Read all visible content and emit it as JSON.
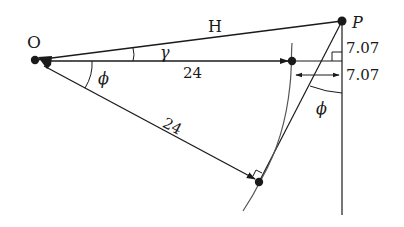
{
  "diagram": {
    "points": {
      "O": {
        "label": "O",
        "x": 36,
        "y": 60
      },
      "P": {
        "label": "P",
        "x": 342,
        "y": 21
      },
      "A": {
        "label": "",
        "x": 292,
        "y": 61
      },
      "B": {
        "label": "",
        "x": 259,
        "y": 182
      }
    },
    "labels": {
      "O": "O",
      "P": "P",
      "H": "H",
      "gamma": "γ",
      "phi_left": "ϕ",
      "phi_right": "ϕ",
      "horizontal_length": "24",
      "slanted_length": "24",
      "vertical_offset": "7.07",
      "horizontal_offset": "7.07"
    },
    "colors": {
      "line": "#1a1a1a",
      "curve": "#555555",
      "background": "#ffffff"
    }
  }
}
